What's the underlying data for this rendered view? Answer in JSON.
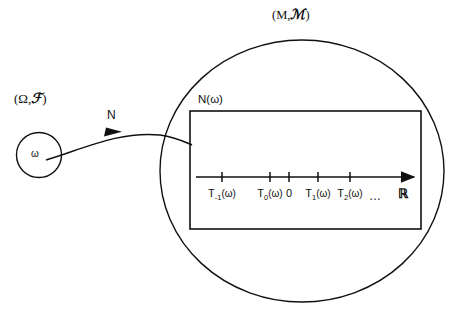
{
  "figure": {
    "background_color": "#ffffff",
    "stroke_color": "#111111"
  },
  "domain_space": {
    "label": "(Ω,",
    "sigma_algebra": "ℱ",
    "label_close": ")",
    "point_label": "ω",
    "shape": "circle"
  },
  "codomain_space": {
    "label": "(M,",
    "sigma_algebra": "ℳ",
    "label_close": ")",
    "shape": "ellipse"
  },
  "mapping": {
    "arrow_label": "N",
    "image_label": "N(ω)"
  },
  "number_line": {
    "axis_symbol": "ℝ",
    "ellipsis": "…",
    "ticks": [
      {
        "name": "T_minus_1",
        "base": "T",
        "sub": "-1",
        "arg": "(ω)",
        "x": 222
      },
      {
        "name": "T_0",
        "base": "T",
        "sub": "0",
        "arg": "(ω)",
        "x": 270
      },
      {
        "name": "zero",
        "base": "0",
        "sub": "",
        "arg": "",
        "x": 289
      },
      {
        "name": "T_1",
        "base": "T",
        "sub": "1",
        "arg": "(ω)",
        "x": 318
      },
      {
        "name": "T_2",
        "base": "T",
        "sub": "2",
        "arg": "(ω)",
        "x": 350
      }
    ]
  }
}
